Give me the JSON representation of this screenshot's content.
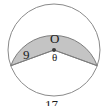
{
  "figure": {
    "kind": "circle-sector-diagram",
    "background_color": "#ffffff",
    "circle": {
      "center_x": 54,
      "center_y": 50,
      "radius": 46,
      "stroke_color": "#8a8a8a",
      "stroke_width": 1,
      "fill_color": "#ffffff"
    },
    "sector": {
      "fill_color": "#c4c4c4",
      "stroke_color": "#7d7d7d",
      "stroke_width": 1,
      "start_angle_deg": 200,
      "end_angle_deg": 340,
      "central_angle_deg": 140
    },
    "center_dot": {
      "radius": 2,
      "color": "#3a3a3a"
    },
    "labels": {
      "center_point": "O",
      "angle": "θ",
      "radius": "9",
      "arc_length": "17"
    }
  }
}
